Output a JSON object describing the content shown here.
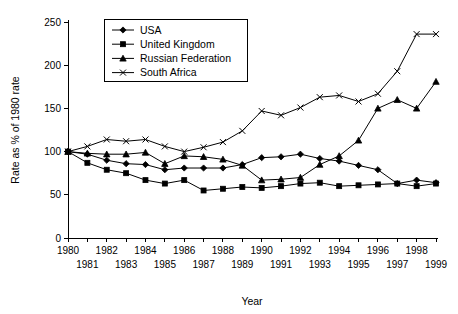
{
  "chart_data": {
    "type": "line",
    "title": "",
    "xlabel": "Year",
    "ylabel": "Rate as % of 1980 rate",
    "x": [
      1980,
      1981,
      1982,
      1983,
      1984,
      1985,
      1986,
      1987,
      1988,
      1989,
      1990,
      1991,
      1992,
      1993,
      1994,
      1995,
      1996,
      1997,
      1998,
      1999
    ],
    "xticklabels_top": [
      "1980",
      "",
      "1982",
      "",
      "1984",
      "",
      "1986",
      "",
      "1988",
      "",
      "1990",
      "",
      "1992",
      "",
      "1994",
      "",
      "1996",
      "",
      "1998",
      ""
    ],
    "xticklabels_bottom": [
      "",
      "1981",
      "",
      "1983",
      "",
      "1985",
      "",
      "1987",
      "",
      "1989",
      "",
      "1991",
      "",
      "1993",
      "",
      "1995",
      "",
      "1997",
      "",
      "1999"
    ],
    "yticklabels": [
      "0",
      "50",
      "100",
      "150",
      "200",
      "250"
    ],
    "yticks": [
      0,
      50,
      100,
      150,
      200,
      250
    ],
    "ylim": [
      0,
      250
    ],
    "xlim": [
      1980,
      1999
    ],
    "grid": false,
    "legend_position": "top-left-inside",
    "series": [
      {
        "name": "USA",
        "marker": "diamond",
        "values": [
          100,
          97,
          90,
          86,
          85,
          79,
          81,
          81,
          81,
          85,
          93,
          94,
          97,
          92,
          89,
          84,
          79,
          63,
          67,
          64
        ]
      },
      {
        "name": "United Kingdom",
        "marker": "square",
        "values": [
          100,
          87,
          79,
          75,
          67,
          63,
          67,
          55,
          57,
          59,
          58,
          60,
          63,
          64,
          60,
          61,
          62,
          63,
          60,
          63
        ]
      },
      {
        "name": "Russian Federation",
        "marker": "triangle",
        "values": [
          100,
          98,
          97,
          97,
          99,
          86,
          95,
          94,
          91,
          84,
          67,
          68,
          70,
          85,
          95,
          113,
          150,
          160,
          150,
          181
        ]
      },
      {
        "name": "South Africa",
        "marker": "cross",
        "values": [
          100,
          106,
          114,
          112,
          114,
          106,
          100,
          105,
          111,
          124,
          147,
          142,
          151,
          163,
          165,
          158,
          167,
          193,
          236,
          236
        ]
      }
    ]
  },
  "legend": {
    "items": [
      {
        "label": "USA"
      },
      {
        "label": "United Kingdom"
      },
      {
        "label": "Russian Federation"
      },
      {
        "label": "South Africa"
      }
    ]
  },
  "axes": {
    "x_title": "Year",
    "y_title": "Rate as % of 1980 rate"
  }
}
